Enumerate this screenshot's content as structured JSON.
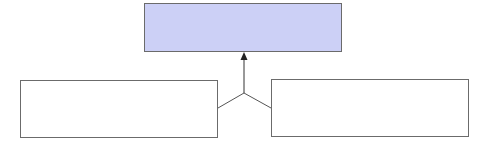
{
  "diagram": {
    "type": "merge-flow",
    "nodes": [
      {
        "id": "top",
        "label": "",
        "fill": "#ccd0f6",
        "x": 144,
        "y": 3,
        "w": 198,
        "h": 49
      },
      {
        "id": "left",
        "label": "",
        "fill": "#ffffff",
        "x": 20,
        "y": 80,
        "w": 198,
        "h": 58
      },
      {
        "id": "right",
        "label": "",
        "fill": "#ffffff",
        "x": 271,
        "y": 79,
        "w": 198,
        "h": 58
      }
    ],
    "edges": [
      {
        "from": "left",
        "to": "junction"
      },
      {
        "from": "right",
        "to": "junction"
      },
      {
        "from": "junction",
        "to": "top",
        "arrow": true
      }
    ],
    "colors": {
      "stroke": "#555555",
      "accent": "#ccd0f6"
    }
  }
}
